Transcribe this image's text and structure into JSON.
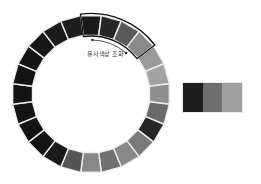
{
  "diagram": {
    "title": "유사색상 조화",
    "wheel": {
      "segment_count": 24,
      "center": [
        91,
        94
      ],
      "outer_radius": 79,
      "inner_radius": 59,
      "start_angle_deg": -97.5,
      "segment_colors": [
        "#1a1a1a",
        "#262626",
        "#5a5a5a",
        "#8a8a8a",
        "#9a9a9a",
        "#a2a2a2",
        "#8e8e8e",
        "#6a6a6a",
        "#262626",
        "#7a7a7a",
        "#888888",
        "#707070",
        "#888888",
        "#555555",
        "#1a1a1a",
        "#141414",
        "#141414",
        "#141414",
        "#141414",
        "#141414",
        "#141414",
        "#171717",
        "#1c1c1c",
        "#1e1e1e"
      ],
      "highlight": {
        "start_index": 0,
        "count": 4,
        "stroke": "#111111"
      },
      "separator_color": "#eeeeee"
    },
    "swatches": [
      {
        "color": "#1e1e1e"
      },
      {
        "color": "#6e6e6e"
      },
      {
        "color": "#a0a0a0"
      }
    ]
  }
}
